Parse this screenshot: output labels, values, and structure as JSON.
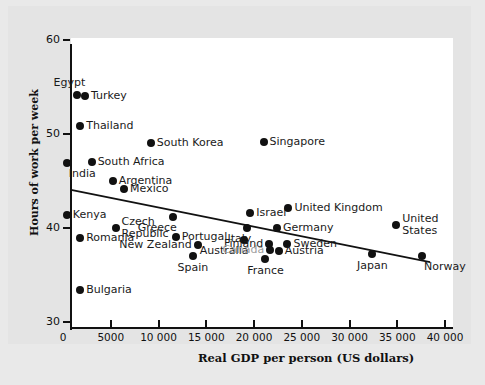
{
  "chart_data": {
    "type": "scatter",
    "title": "",
    "xlabel": "Real GDP per person (US dollars)",
    "ylabel": "Hours of work per week",
    "xlim": [
      0,
      40000
    ],
    "ylim": [
      30,
      60
    ],
    "grid": false,
    "legend": "none",
    "xticks": [
      "0",
      "5000",
      "10 000",
      "15 000",
      "20 000",
      "25 000",
      "30 000",
      "35 000",
      "40 000"
    ],
    "xtick_values": [
      0,
      5000,
      10000,
      15000,
      20000,
      25000,
      30000,
      35000,
      40000
    ],
    "yticks": [
      "30",
      "40",
      "50",
      "60"
    ],
    "ytick_values": [
      30,
      40,
      50,
      60
    ],
    "trendline": {
      "label": "fitted line",
      "x_start": 0,
      "y_start": 44.7,
      "x_end": 37600,
      "y_end": 37.0
    },
    "points": [
      {
        "name": "Egypt",
        "x": 1500,
        "y": 54.1,
        "label_pos": "above-left",
        "label_color": "#1a1a1a"
      },
      {
        "name": "Turkey",
        "x": 2300,
        "y": 54.0,
        "label_pos": "right",
        "label_color": "#1a1a1a"
      },
      {
        "name": "Thailand",
        "x": 1800,
        "y": 50.8,
        "label_pos": "right",
        "label_color": "#1a1a1a"
      },
      {
        "name": "South Korea",
        "x": 9200,
        "y": 49.0,
        "label_pos": "right",
        "label_color": "#1a1a1a"
      },
      {
        "name": "Singapore",
        "x": 21000,
        "y": 49.2,
        "label_pos": "right",
        "label_color": "#1a1a1a"
      },
      {
        "name": "South Africa",
        "x": 3000,
        "y": 47.0,
        "label_pos": "right",
        "label_color": "#1a1a1a"
      },
      {
        "name": "India",
        "x": 400,
        "y": 46.9,
        "label_pos": "below-right",
        "label_color": "#1a1a1a"
      },
      {
        "name": "Argentina",
        "x": 5200,
        "y": 45.0,
        "label_pos": "right",
        "label_color": "#1a1a1a"
      },
      {
        "name": "Mexico",
        "x": 6400,
        "y": 44.1,
        "label_pos": "right",
        "label_color": "#1a1a1a"
      },
      {
        "name": "Kenya",
        "x": 400,
        "y": 41.4,
        "label_pos": "right",
        "label_color": "#1a1a1a"
      },
      {
        "name": "Czech Republic",
        "x": 5500,
        "y": 40.0,
        "label_pos": "right-two",
        "label_color": "#1a1a1a"
      },
      {
        "name": "Greece",
        "x": 11500,
        "y": 41.2,
        "label_pos": "below-left",
        "label_color": "#1a1a1a"
      },
      {
        "name": "Israel",
        "x": 19600,
        "y": 41.6,
        "label_pos": "right",
        "label_color": "#1a1a1a"
      },
      {
        "name": "United Kingdom",
        "x": 23600,
        "y": 42.1,
        "label_pos": "right",
        "label_color": "#1a1a1a"
      },
      {
        "name": "United States",
        "x": 34900,
        "y": 40.3,
        "label_pos": "right-two",
        "label_color": "#1a1a1a"
      },
      {
        "name": "Italy",
        "x": 19300,
        "y": 40.0,
        "label_pos": "below-left",
        "label_color": "#1a1a1a"
      },
      {
        "name": "Germany",
        "x": 22400,
        "y": 40.0,
        "label_pos": "right",
        "label_color": "#1a1a1a"
      },
      {
        "name": "Romania",
        "x": 1800,
        "y": 38.9,
        "label_pos": "right",
        "label_color": "#1a1a1a"
      },
      {
        "name": "Portugal",
        "x": 11800,
        "y": 39.0,
        "label_pos": "right",
        "label_color": "#1a1a1a"
      },
      {
        "name": "New Zealand",
        "x": 14100,
        "y": 38.2,
        "label_pos": "left",
        "label_color": "#1a1a1a"
      },
      {
        "name": "Australia",
        "x": 19000,
        "y": 38.7,
        "label_pos": "below-left",
        "label_color": "#1a1a1a"
      },
      {
        "name": "Finland",
        "x": 21600,
        "y": 38.3,
        "label_pos": "left",
        "label_color": "#1a1a1a"
      },
      {
        "name": "Sweden",
        "x": 23500,
        "y": 38.3,
        "label_pos": "right",
        "label_color": "#1a1a1a"
      },
      {
        "name": "Canada",
        "x": 21700,
        "y": 37.7,
        "label_pos": "left",
        "label_color": "#9d9d9d"
      },
      {
        "name": "Austria",
        "x": 22600,
        "y": 37.6,
        "label_pos": "right",
        "label_color": "#1a1a1a"
      },
      {
        "name": "Spain",
        "x": 13600,
        "y": 37.0,
        "label_pos": "below",
        "label_color": "#1a1a1a"
      },
      {
        "name": "France",
        "x": 21200,
        "y": 36.7,
        "label_pos": "below",
        "label_color": "#1a1a1a"
      },
      {
        "name": "Japan",
        "x": 32400,
        "y": 37.2,
        "label_pos": "below",
        "label_color": "#1a1a1a"
      },
      {
        "name": "Norway",
        "x": 37600,
        "y": 37.0,
        "label_pos": "below-right",
        "label_color": "#1a1a1a"
      },
      {
        "name": "Bulgaria",
        "x": 1800,
        "y": 33.4,
        "label_pos": "right",
        "label_color": "#1a1a1a"
      }
    ]
  }
}
